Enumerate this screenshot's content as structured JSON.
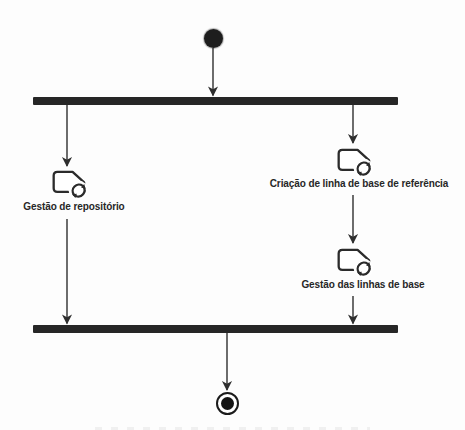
{
  "diagram": {
    "kind": "UML activity diagram",
    "direction": "top-to-bottom",
    "colors": {
      "ink": "#2e2e2e",
      "bar": "#262626",
      "background": "#fdfdfd"
    },
    "activities": [
      {
        "label": "Gestão de repositório",
        "icon": "tag-refresh-icon",
        "branch": "left"
      },
      {
        "label": "Criação de linha de base de referência",
        "icon": "tag-refresh-icon",
        "branch": "right"
      },
      {
        "label": "Gestão das linhas de base",
        "icon": "tag-refresh-icon",
        "branch": "right"
      }
    ],
    "nodes": [
      "initial-node",
      "fork-bar",
      "join-bar",
      "activity-final-node"
    ],
    "edges": [
      {
        "from": "initial-node",
        "to": "fork-bar"
      },
      {
        "from": "fork-bar",
        "to": "Gestão de repositório"
      },
      {
        "from": "fork-bar",
        "to": "Criação de linha de base de referência"
      },
      {
        "from": "Criação de linha de base de referência",
        "to": "Gestão das linhas de base"
      },
      {
        "from": "Gestão de repositório",
        "to": "join-bar"
      },
      {
        "from": "Gestão das linhas de base",
        "to": "join-bar"
      },
      {
        "from": "join-bar",
        "to": "activity-final-node"
      }
    ]
  }
}
